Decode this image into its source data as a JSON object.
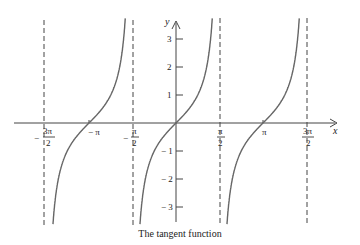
{
  "caption": "The tangent function",
  "axes": {
    "x_label": "x",
    "y_label": "y",
    "x_ticks": [
      {
        "value": "-3π/2",
        "sign": "−",
        "num": "3π",
        "den": "2",
        "px": 44
      },
      {
        "value": "-π",
        "label": "− π",
        "px": 89
      },
      {
        "value": "-π/2",
        "sign": "−",
        "num": "π",
        "den": "2",
        "px": 133
      },
      {
        "value": "π/2",
        "num": "π",
        "den": "2",
        "px": 220
      },
      {
        "value": "π",
        "label": "π",
        "px": 263
      },
      {
        "value": "3π/2",
        "num": "3π",
        "den": "2",
        "px": 307
      }
    ],
    "y_ticks": [
      {
        "value": 3,
        "label": "3"
      },
      {
        "value": 2,
        "label": "2"
      },
      {
        "value": 1,
        "label": "1"
      },
      {
        "value": -1,
        "label": "− 1"
      },
      {
        "value": -2,
        "label": "− 2"
      },
      {
        "value": -3,
        "label": "− 3"
      }
    ]
  },
  "chart_data": {
    "type": "line",
    "title": "The tangent function",
    "function": "y = tan(x)",
    "xlabel": "x",
    "ylabel": "y",
    "x_ticks": [
      "-3π/2",
      "-π",
      "-π/2",
      "π/2",
      "π",
      "3π/2"
    ],
    "y_ticks": [
      -3,
      -2,
      -1,
      1,
      2,
      3
    ],
    "xlim": [
      -4.9,
      5.3
    ],
    "ylim": [
      -3.7,
      3.8
    ],
    "asymptotes": [
      "x = -3π/2",
      "x = -π/2",
      "x = π/2",
      "x = 3π/2"
    ],
    "branches": [
      {
        "interval": "(-3π/2, -π/2)",
        "zero": "-π"
      },
      {
        "interval": "(-π/2, π/2)",
        "zero": "0"
      },
      {
        "interval": "(π/2, 3π/2)",
        "zero": "π"
      }
    ],
    "series": [
      {
        "name": "tan(x)",
        "x": [
          -1.5708,
          -1.2,
          -0.785,
          -0.4,
          0,
          0.4,
          0.785,
          1.2,
          1.5708
        ],
        "values": [
          "-inf",
          -2.572,
          -1.0,
          -0.423,
          0,
          0.423,
          1.0,
          2.572,
          "inf"
        ]
      }
    ],
    "grid": false,
    "legend": "none"
  }
}
